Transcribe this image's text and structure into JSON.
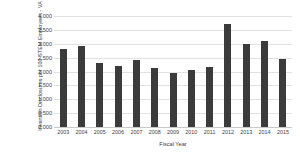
{
  "chart_data": {
    "type": "bar",
    "title": "",
    "xlabel": "Fiscal Year",
    "ylabel": "Invention Disclosures per 100 STEM Employees - VA",
    "categories": [
      "2003",
      "2004",
      "2005",
      "2006",
      "2007",
      "2008",
      "2009",
      "2010",
      "2011",
      "2012",
      "2013",
      "2014",
      "2015"
    ],
    "values": [
      2.8,
      2.93,
      2.3,
      2.2,
      2.42,
      2.12,
      1.95,
      2.06,
      2.18,
      3.73,
      2.99,
      3.1,
      2.45
    ],
    "ylim": [
      0,
      4
    ],
    "ytick_labels": [
      "4.000",
      "3.500",
      "3.000",
      "2.500",
      "2.000",
      "1.500",
      "1.000",
      "0.500",
      "0.000"
    ],
    "ytick_values": [
      4.0,
      3.5,
      3.0,
      2.5,
      2.0,
      1.5,
      1.0,
      0.5,
      0.0
    ],
    "grid": true,
    "legend": false,
    "bar_color": "#3b3b3b",
    "gridline_color": "#e2e2e2",
    "background_color": "#ffffff"
  }
}
